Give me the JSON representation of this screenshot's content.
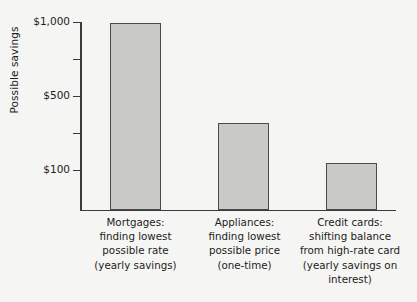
{
  "chart_data": {
    "type": "bar",
    "title": "",
    "xlabel": "",
    "ylabel": "Possible savings",
    "categories": [
      "Mortgages:\nfinding lowest\npossible rate\n(yearly savings)",
      "Appliances:\nfinding lowest\npossible price\n(one-time)",
      "Credit cards:\nshifting balance\nfrom high-rate card\n(yearly savings on\ninterest)"
    ],
    "category_short": [
      "Mortgages",
      "Appliances",
      "Credit cards"
    ],
    "values": [
      990,
      380,
      140
    ],
    "value_unit": "USD",
    "ylim": [
      -170,
      1000
    ],
    "ytick_values": [
      1000,
      750,
      500,
      250,
      100
    ],
    "ytick_labels": [
      "$1,000",
      "",
      "$500",
      "",
      "$100"
    ],
    "ytick_labeled": [
      "$1,000",
      "$500",
      "$100"
    ],
    "grid": false,
    "legend": false,
    "legend_position": "none",
    "bar_fill_color": "#c9c9c7",
    "bar_edge_color": "#4a4a4a",
    "background_color": "#f5f5f3",
    "axis_color": "#3a3a3a"
  },
  "axis": {
    "y_title": "Possible savings"
  }
}
